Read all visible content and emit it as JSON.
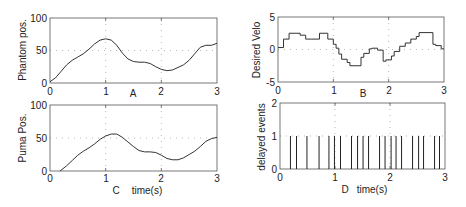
{
  "chart_data": [
    {
      "id": "A",
      "type": "line",
      "panel_label": "A",
      "xlabel": "",
      "ylabel": "Phantom pos.",
      "xlim": [
        0,
        3
      ],
      "ylim": [
        0,
        100
      ],
      "xticks": [
        "0",
        "1",
        "2",
        "3"
      ],
      "yticks": [
        "0",
        "50",
        "100"
      ],
      "grid": true,
      "x": [
        0,
        0.1,
        0.2,
        0.3,
        0.4,
        0.5,
        0.6,
        0.7,
        0.8,
        0.9,
        1.0,
        1.1,
        1.2,
        1.3,
        1.4,
        1.5,
        1.6,
        1.7,
        1.8,
        1.9,
        2.0,
        2.1,
        2.2,
        2.3,
        2.4,
        2.5,
        2.6,
        2.7,
        2.8,
        2.9,
        3.0
      ],
      "values": [
        2,
        8,
        18,
        28,
        35,
        40,
        45,
        52,
        60,
        66,
        68,
        66,
        58,
        46,
        37,
        33,
        32,
        32,
        30,
        25,
        21,
        19,
        20,
        24,
        28,
        35,
        45,
        55,
        58,
        58,
        61
      ]
    },
    {
      "id": "B",
      "type": "line",
      "panel_label": "B",
      "xlabel": "",
      "ylabel": "Desired Velo",
      "xlim": [
        0,
        3
      ],
      "ylim": [
        -5,
        5
      ],
      "xticks": [
        "0",
        "1",
        "2",
        "3"
      ],
      "yticks": [
        "-5",
        "0",
        "5"
      ],
      "grid": true,
      "step": true,
      "x": [
        0,
        0.1,
        0.2,
        0.4,
        0.5,
        0.6,
        0.75,
        0.9,
        1.0,
        1.05,
        1.1,
        1.15,
        1.25,
        1.3,
        1.5,
        1.55,
        1.65,
        1.7,
        1.8,
        1.9,
        1.95,
        2.05,
        2.1,
        2.2,
        2.3,
        2.4,
        2.5,
        2.55,
        2.8,
        2.85,
        2.95,
        3.0
      ],
      "values": [
        0.3,
        1.6,
        2.5,
        2.2,
        1.6,
        1.6,
        2.5,
        1.6,
        0.8,
        0.2,
        -0.7,
        -1.5,
        -2.0,
        -2.5,
        -1.2,
        -0.6,
        0.1,
        0.2,
        -0.1,
        -1.8,
        -1.6,
        -1.0,
        -0.3,
        0.5,
        1.0,
        1.6,
        2.0,
        2.6,
        0.8,
        0.6,
        0.1,
        0.1
      ]
    },
    {
      "id": "C",
      "type": "line",
      "panel_label": "C",
      "xlabel": "time(s)",
      "ylabel": "Puma Pos.",
      "xlim": [
        0,
        3
      ],
      "ylim": [
        0,
        100
      ],
      "xticks": [
        "0",
        "1",
        "2",
        "3"
      ],
      "yticks": [
        "0",
        "50",
        "100"
      ],
      "grid": true,
      "x": [
        0.18,
        0.3,
        0.4,
        0.5,
        0.6,
        0.7,
        0.8,
        0.9,
        1.0,
        1.1,
        1.2,
        1.3,
        1.4,
        1.5,
        1.6,
        1.7,
        1.8,
        1.9,
        2.0,
        2.1,
        2.2,
        2.3,
        2.4,
        2.5,
        2.6,
        2.7,
        2.8,
        2.9,
        3.0
      ],
      "values": [
        0,
        8,
        16,
        24,
        30,
        35,
        41,
        48,
        53,
        56,
        56,
        51,
        44,
        37,
        31,
        29,
        29,
        28,
        24,
        19,
        17,
        17,
        20,
        25,
        30,
        37,
        45,
        49,
        51
      ]
    },
    {
      "id": "D",
      "type": "bar",
      "panel_label": "D",
      "xlabel": "time(s)",
      "ylabel": "delayed events",
      "xlim": [
        0,
        3
      ],
      "ylim": [
        0,
        2
      ],
      "xticks": [
        "0",
        "1",
        "2",
        "3"
      ],
      "yticks": [
        "0",
        "1",
        "2"
      ],
      "grid": true,
      "x": [
        0.19,
        0.3,
        0.49,
        0.71,
        0.89,
        0.99,
        1.1,
        1.3,
        1.41,
        1.51,
        1.61,
        1.81,
        1.91,
        2.02,
        2.11,
        2.21,
        2.41,
        2.52,
        2.61,
        2.81,
        2.9
      ],
      "values": [
        1,
        1,
        1,
        1,
        1,
        1,
        1,
        1,
        1,
        1,
        1,
        1,
        1,
        1,
        1,
        1,
        1,
        1,
        1,
        1,
        1
      ]
    }
  ],
  "labels": {
    "A": {
      "panel": "A",
      "ylabel": "Phantom pos.",
      "xt0": "0",
      "xt1": "1",
      "xt2": "2",
      "xt3": "3",
      "yt0": "0",
      "yt1": "50",
      "yt2": "100"
    },
    "B": {
      "panel": "B",
      "ylabel": "Desired Velo",
      "xt0": "0",
      "xt1": "1",
      "xt2": "2",
      "xt3": "3",
      "yt0": "-5",
      "yt1": "0",
      "yt2": "5"
    },
    "C": {
      "panel": "C",
      "xlabel": "time(s)",
      "ylabel": "Puma Pos.",
      "xt0": "0",
      "xt1": "1",
      "xt2": "2",
      "xt3": "3",
      "yt0": "0",
      "yt1": "50",
      "yt2": "100"
    },
    "D": {
      "panel": "D",
      "xlabel": "time(s)",
      "ylabel": "delayed events",
      "xt0": "0",
      "xt1": "1",
      "xt2": "2",
      "xt3": "3",
      "yt0": "0",
      "yt1": "1",
      "yt2": "2"
    }
  }
}
